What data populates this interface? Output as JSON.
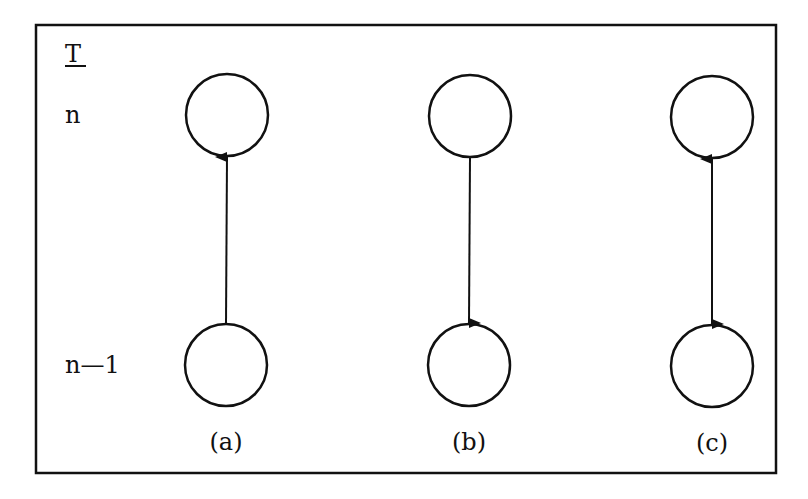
{
  "diagram": {
    "axis_label": "T",
    "levels": [
      {
        "id": "top",
        "label": "n"
      },
      {
        "id": "bottom",
        "label": "n—1"
      }
    ],
    "panels": [
      {
        "id": "a",
        "caption": "(a)",
        "arrow": "up"
      },
      {
        "id": "b",
        "caption": "(b)",
        "arrow": "down"
      },
      {
        "id": "c",
        "caption": "(c)",
        "arrow": "both"
      }
    ],
    "colors": {
      "stroke": "#111111",
      "background": "#ffffff"
    }
  }
}
